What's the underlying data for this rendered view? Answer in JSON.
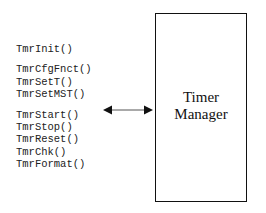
{
  "functions": {
    "group1": [
      "TmrInit()"
    ],
    "group2": [
      "TmrCfgFnct()",
      "TmrSetT()",
      "TmrSetMST()"
    ],
    "group3": [
      "TmrStart()",
      "TmrStop()",
      "TmrReset()",
      "TmrChk()",
      "TmrFormat()"
    ]
  },
  "box": {
    "line1": "Timer",
    "line2": "Manager"
  },
  "arrow": {
    "type": "bidirectional-arrow",
    "color": "#111111"
  }
}
